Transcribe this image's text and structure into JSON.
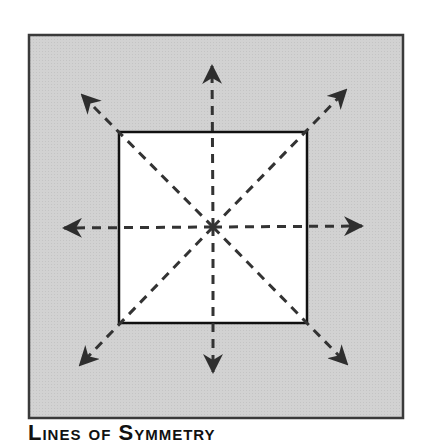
{
  "figure": {
    "caption": "Lines of Symmetry",
    "colors": {
      "frame_fill": "#cfcfcf",
      "frame_border": "#3a3a3a",
      "square_fill": "#ffffff",
      "square_border": "#111111",
      "line_color": "#333333"
    },
    "frame": {
      "x": 29,
      "y": 35,
      "width": 374,
      "height": 383
    },
    "square": {
      "x": 119,
      "y": 132,
      "width": 188,
      "height": 191
    },
    "center": {
      "x": 213,
      "y": 227
    },
    "arrows": [
      {
        "name": "up",
        "tip": [
          212,
          66
        ]
      },
      {
        "name": "down",
        "tip": [
          213,
          372
        ]
      },
      {
        "name": "left",
        "tip": [
          64,
          228
        ]
      },
      {
        "name": "right",
        "tip": [
          362,
          226
        ]
      },
      {
        "name": "up-left",
        "tip": [
          82,
          95
        ]
      },
      {
        "name": "up-right",
        "tip": [
          346,
          90
        ]
      },
      {
        "name": "down-left",
        "tip": [
          80,
          365
        ]
      },
      {
        "name": "down-right",
        "tip": [
          347,
          364
        ]
      }
    ]
  }
}
